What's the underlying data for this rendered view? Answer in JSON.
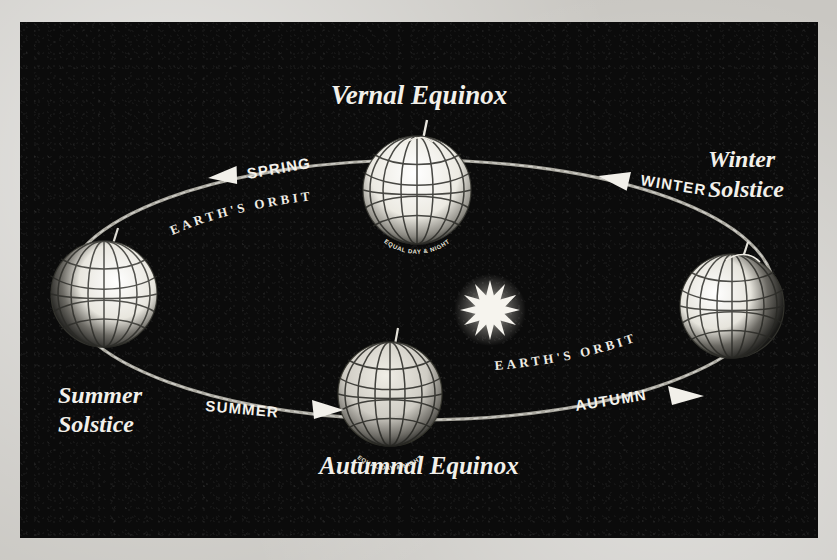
{
  "diagram": {
    "title_hidden": "Earth's orbit and the seasons",
    "background_color": "#0b0b0b",
    "ink_color": "#f2f0ea",
    "page_color": "#c9c7c2"
  },
  "labels": {
    "vernal_equinox": "Vernal Equinox",
    "autumnal_equinox": "Autumnal Equinox",
    "summer_solstice_line1": "Summer",
    "summer_solstice_line2": "Solstice",
    "winter_solstice_line1": "Winter",
    "winter_solstice_line2": "Solstice"
  },
  "seasons": [
    {
      "name": "SPRING",
      "arrow": "left-arrow-icon",
      "position": "upper-left"
    },
    {
      "name": "WINTER",
      "arrow": "left-arrow-icon",
      "position": "upper-right"
    },
    {
      "name": "SUMMER",
      "arrow": "right-arrow-icon",
      "position": "lower-left"
    },
    {
      "name": "AUTUMN",
      "arrow": "right-arrow-icon",
      "position": "lower-right"
    }
  ],
  "orbit": {
    "label_left": "EARTH'S ORBIT",
    "label_right": "EARTH'S ORBIT"
  },
  "globes": [
    {
      "id": "vernal",
      "caption": "EQUAL DAY & NIGHT",
      "lit_side": "front"
    },
    {
      "id": "autumnal",
      "caption": "EQUAL DAY & NIGHT",
      "lit_side": "front"
    },
    {
      "id": "summer",
      "caption": "",
      "lit_side": "right"
    },
    {
      "id": "winter",
      "caption": "",
      "lit_side": "left"
    }
  ],
  "sun": {
    "name": "sun-star-icon",
    "points": 12,
    "color": "#f6f4ee"
  }
}
